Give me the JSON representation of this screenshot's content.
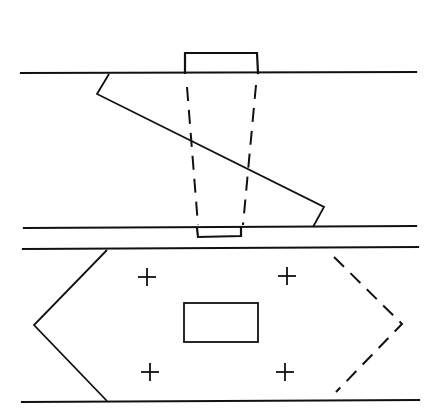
{
  "diagram": {
    "colors": {
      "background": "#ffffff",
      "line": "#111111"
    },
    "side_view": {
      "top_line": {
        "x1": 21,
        "y1": 73,
        "x2": 416,
        "y2": 72
      },
      "bottom_line": {
        "x1": 24,
        "y1": 228,
        "x2": 416,
        "y2": 226
      },
      "top_block": {
        "points": "185,73 185,53 257,53 258,73"
      },
      "bottom_block": {
        "points": "197,228 198,237 241,236 241,227"
      },
      "diagonal": {
        "points": "109,74 97,94 324,207 313,227"
      },
      "dashed_left": {
        "x1": 187,
        "y1": 87,
        "x2": 198,
        "y2": 225
      },
      "dashed_right": {
        "x1": 256,
        "y1": 85,
        "x2": 243,
        "y2": 225
      }
    },
    "plan_view": {
      "top_line": {
        "x1": 23,
        "y1": 249,
        "x2": 418,
        "y2": 247
      },
      "bottom_line": {
        "x1": 22,
        "y1": 402,
        "x2": 419,
        "y2": 400
      },
      "left_chevron": {
        "points": "107,250 34,325 107,401"
      },
      "right_chevron_dashed": {
        "points": "334,257 402,324 336,392"
      },
      "center_rect": {
        "x": 184,
        "y": 303,
        "width": 74,
        "height": 39
      },
      "crosses": [
        {
          "cx": 147,
          "cy": 277
        },
        {
          "cx": 287,
          "cy": 276
        },
        {
          "cx": 150,
          "cy": 372
        },
        {
          "cx": 285,
          "cy": 372
        }
      ],
      "cross_half_size": 9
    }
  }
}
